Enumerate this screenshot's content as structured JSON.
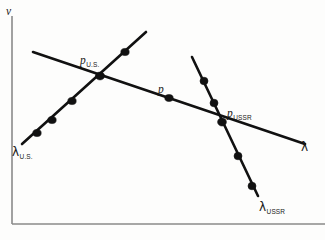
{
  "figure": {
    "title": "",
    "axis": {
      "y_label": "v",
      "x_label": "λ",
      "origin_x": 12,
      "origin_y": 224,
      "y_top": 16,
      "x_right": 325
    },
    "labels": {
      "p_us": {
        "symbol": "p",
        "subscript": "U.S."
      },
      "p": {
        "symbol": "p",
        "subscript": ""
      },
      "p_ussr": {
        "symbol": "p",
        "subscript": "USSR"
      },
      "lambda_us": {
        "symbol": "λ",
        "subscript": "U.S."
      },
      "lambda": {
        "symbol": "λ",
        "subscript": ""
      },
      "lambda_ussr": {
        "symbol": "λ",
        "subscript": "USSR"
      }
    },
    "colors": {
      "line": "#111111",
      "axis": "#8a8a8a",
      "background": "#fdfdfc",
      "text": "#1a1a1a"
    }
  },
  "chart_data": {
    "type": "line",
    "title": "",
    "xlabel": "λ",
    "ylabel": "v",
    "grid": false,
    "legend": "none",
    "axis_pixels": {
      "x_origin": 12,
      "y_origin": 224,
      "y_top": 16,
      "x_right": 325
    },
    "series": [
      {
        "name": "λ (common demand line)",
        "label": "λ",
        "description": "Shallow downward-sloping straight line running left to right across the plot",
        "endpoints_px": [
          [
            33,
            52
          ],
          [
            305,
            144
          ]
        ],
        "points_px": [
          [
            169,
            98
          ]
        ],
        "point_labels": [
          "p"
        ],
        "slope_sign": "negative"
      },
      {
        "name": "λ U.S.",
        "label": "λ_U.S.",
        "description": "Upward-sloping straight line rising from lower left to upper middle",
        "endpoints_px": [
          [
            22,
            144
          ],
          [
            146,
            32
          ]
        ],
        "points_px": [
          [
            37,
            133
          ],
          [
            52,
            120
          ],
          [
            72,
            101
          ],
          [
            100,
            76
          ],
          [
            125,
            52
          ]
        ],
        "point_labels": [
          "",
          "",
          "",
          "",
          ""
        ],
        "slope_sign": "positive"
      },
      {
        "name": "λ USSR",
        "label": "λ_USSR",
        "description": "Steeply downward-sloping straight line from upper middle-right down to lower right",
        "endpoints_px": [
          [
            192,
            57
          ],
          [
            258,
            196
          ]
        ],
        "points_px": [
          [
            204,
            81
          ],
          [
            214,
            103
          ],
          [
            238,
            156
          ],
          [
            252,
            186
          ]
        ],
        "point_labels": [
          "",
          "",
          "",
          ""
        ],
        "slope_sign": "negative-steep"
      }
    ],
    "intersections": [
      {
        "label": "p_U.S.",
        "x_px": 100,
        "y_px": 76,
        "between": [
          "λ",
          "λ U.S."
        ]
      },
      {
        "label": "p_USSR",
        "x_px": 222,
        "y_px": 122,
        "between": [
          "λ",
          "λ USSR"
        ]
      }
    ],
    "annotations": [
      {
        "text": "p",
        "x_px": 158,
        "y_px": 80
      },
      {
        "text": "p_U.S.",
        "x_px": 80,
        "y_px": 51
      },
      {
        "text": "p_USSR",
        "x_px": 227,
        "y_px": 104
      },
      {
        "text": "λ_U.S.",
        "x_px": 12,
        "y_px": 143
      },
      {
        "text": "λ",
        "x_px": 301,
        "y_px": 138
      },
      {
        "text": "λ_USSR",
        "x_px": 259,
        "y_px": 198
      },
      {
        "text": "v",
        "x_px": 6,
        "y_px": 2
      }
    ]
  }
}
